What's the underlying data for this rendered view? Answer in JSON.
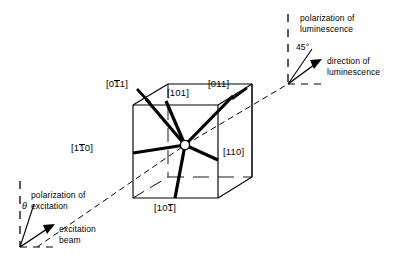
{
  "figure": {
    "kind": "crystallographic-orientation-diagram"
  },
  "cube": {
    "center_marker": "central-atom-circle",
    "bond_labels": [
      {
        "id": "bond-0-1bar-1",
        "prefix": "[0",
        "bar": "1",
        "suffix": "1]"
      },
      {
        "id": "bond-101",
        "prefix": "[101]",
        "bar": "",
        "suffix": ""
      },
      {
        "id": "bond-011",
        "prefix": "[011]",
        "bar": "",
        "suffix": ""
      },
      {
        "id": "bond-1-1bar-0",
        "prefix": "[1",
        "bar": "1",
        "suffix": "0]"
      },
      {
        "id": "bond-110",
        "prefix": "[110]",
        "bar": "",
        "suffix": ""
      },
      {
        "id": "bond-10-1bar",
        "prefix": "[10",
        "bar": "1",
        "suffix": "]"
      }
    ]
  },
  "luminescence": {
    "polarization_line1": "polarization of",
    "polarization_line2": "luminescence",
    "angle": "45°",
    "direction_line1": "direction of",
    "direction_line2": "luminescence"
  },
  "excitation": {
    "polarization_line1": "polarization of",
    "polarization_line2": "excitation",
    "angle_symbol": "θ",
    "beam_line1": "excitation",
    "beam_line2": "beam"
  },
  "colors": {
    "ink": "#000000",
    "paper": "#ffffff"
  }
}
